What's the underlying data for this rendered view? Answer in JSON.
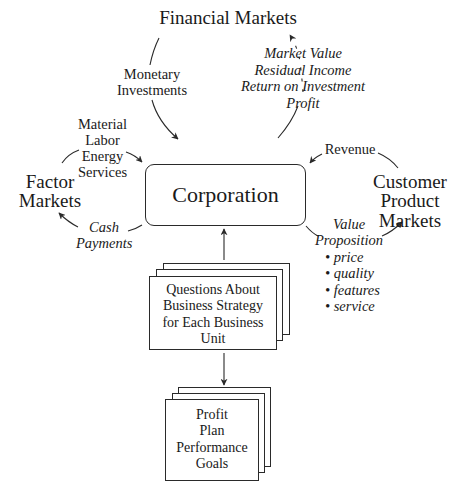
{
  "diagram": {
    "type": "flow-diagram",
    "nodes": {
      "financial_markets": {
        "label": "Financial Markets"
      },
      "factor_markets": {
        "lines": [
          "Factor",
          "Markets"
        ]
      },
      "customer_product_markets": {
        "lines": [
          "Customer",
          "Product",
          "Markets"
        ]
      },
      "corporation": {
        "label": "Corporation"
      },
      "business_strategy": {
        "lines": [
          "Questions About",
          "Business Strategy",
          "for Each Business",
          "Unit"
        ]
      },
      "profit_plan": {
        "lines": [
          "Profit",
          "Plan",
          "Performance",
          "Goals"
        ]
      }
    },
    "flows": {
      "monetary_investments": {
        "lines": [
          "Monetary",
          "Investments"
        ],
        "from": "Financial Markets",
        "to": "Corporation"
      },
      "returns": {
        "lines": [
          "Market Value",
          "Residual Income",
          "Return on Investment",
          "Profit"
        ],
        "from": "Corporation",
        "to": "Financial Markets"
      },
      "factor_inputs": {
        "lines": [
          "Material",
          "Labor",
          "Energy",
          "Services"
        ],
        "from": "Factor Markets",
        "to": "Corporation"
      },
      "cash_payments": {
        "lines": [
          "Cash",
          "Payments"
        ],
        "from": "Corporation",
        "to": "Factor Markets"
      },
      "revenue": {
        "label": "Revenue",
        "from": "Customer Product Markets",
        "to": "Corporation"
      },
      "value_proposition": {
        "lines": [
          "Value",
          "Proposition"
        ],
        "bullets": [
          "price",
          "quality",
          "features",
          "service"
        ],
        "from": "Corporation",
        "to": "Customer Product Markets"
      },
      "strategy_to_corporation": {
        "from": "Questions About Business Strategy for Each Business Unit",
        "to": "Corporation"
      },
      "strategy_to_profit_plan": {
        "from": "Questions About Business Strategy for Each Business Unit",
        "to": "Profit Plan Performance Goals"
      }
    },
    "colors": {
      "line": "#2a2a2a",
      "text": "#1a1a1a",
      "background": "#ffffff"
    }
  }
}
